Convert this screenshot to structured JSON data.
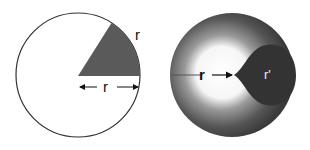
{
  "diagram": {
    "left_panel": {
      "description": "Circle with shaded sector (one radian): arc length equals radius",
      "arc_label": "r",
      "radius_label": "← r →",
      "radius_text": "r",
      "sector_color": "#5a5a5a",
      "outline_color": "#333333"
    },
    "right_panel": {
      "description": "Shaded sphere with gradient and dark inner region, radius r pointing to inner point",
      "outer_label": "r",
      "inner_label": "r'",
      "outer_color": "#444444",
      "inner_color": "#333333",
      "highlight_color": "#ffffff"
    }
  }
}
